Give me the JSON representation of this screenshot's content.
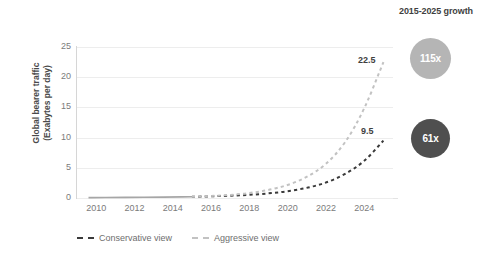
{
  "annotation": {
    "growth_title": "2015-2025 growth",
    "bubbles": [
      {
        "name": "aggressive",
        "value": "115x",
        "color": "#b5b5b5"
      },
      {
        "name": "conservative",
        "value": "61x",
        "color": "#4f4f4f"
      }
    ]
  },
  "labels": {
    "aggressive_end": "22.5",
    "conservative_end": "9.5"
  },
  "chart_data": {
    "type": "line",
    "title": "",
    "xlabel": "",
    "ylabel": "Global bearer traffic (Exabytes per day)",
    "ylabel_line1": "Global bearer traffic",
    "ylabel_line2": "(Exabytes per day)",
    "xlim": [
      2009,
      2025.5
    ],
    "ylim": [
      0,
      25
    ],
    "yticks": [
      25,
      20,
      15,
      10,
      5,
      0
    ],
    "xticks": [
      2010,
      2012,
      2014,
      2016,
      2018,
      2020,
      2022,
      2024
    ],
    "grid": "horizontal",
    "legend_position": "bottom-left",
    "series": [
      {
        "name": "Historical",
        "style": "solid",
        "color": "#a6a6a6",
        "x": [
          2009.6,
          2010,
          2011,
          2012,
          2013,
          2014,
          2015
        ],
        "values": [
          0.06,
          0.07,
          0.09,
          0.11,
          0.13,
          0.16,
          0.2
        ]
      },
      {
        "name": "Conservative view",
        "style": "dashed",
        "color": "#3a3a3a",
        "x": [
          2015,
          2016,
          2017,
          2018,
          2019,
          2020,
          2021,
          2022,
          2023,
          2024,
          2025
        ],
        "values": [
          0.2,
          0.28,
          0.38,
          0.52,
          0.75,
          1.1,
          1.65,
          2.5,
          3.9,
          6.0,
          9.5
        ]
      },
      {
        "name": "Aggressive view",
        "style": "dashed",
        "color": "#c2c2c2",
        "x": [
          2015,
          2016,
          2017,
          2018,
          2019,
          2020,
          2021,
          2022,
          2023,
          2024,
          2025
        ],
        "values": [
          0.2,
          0.32,
          0.5,
          0.8,
          1.3,
          2.1,
          3.4,
          5.5,
          9.0,
          14.6,
          22.5
        ]
      }
    ],
    "legend": [
      {
        "label": "Conservative view",
        "color": "#3a3a3a",
        "style": "dashed"
      },
      {
        "label": "Aggressive view",
        "color": "#c2c2c2",
        "style": "dashed"
      }
    ],
    "annotations": [
      {
        "text": "22.5",
        "series": "Aggressive view",
        "x": 2025,
        "y": 22.5
      },
      {
        "text": "9.5",
        "series": "Conservative view",
        "x": 2025,
        "y": 9.5
      },
      {
        "text": "115x",
        "kind": "bubble",
        "series": "Aggressive view"
      },
      {
        "text": "61x",
        "kind": "bubble",
        "series": "Conservative view"
      },
      {
        "text": "2015-2025 growth",
        "kind": "title"
      }
    ]
  }
}
